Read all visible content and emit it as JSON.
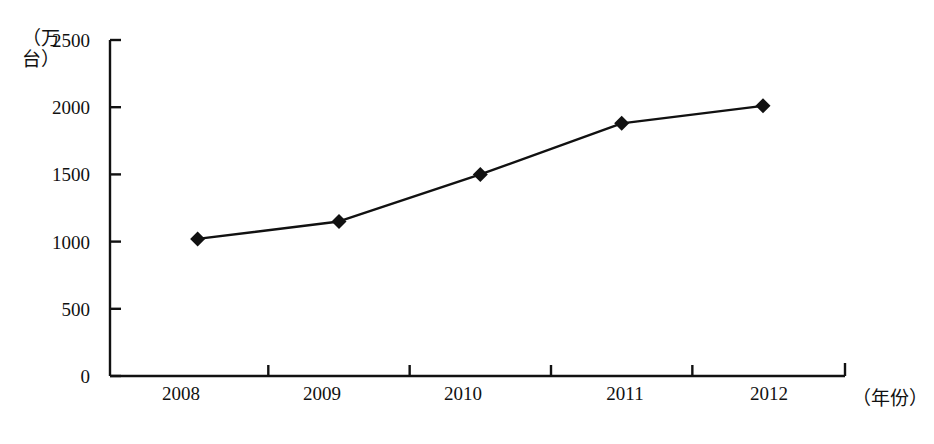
{
  "chart_data": {
    "type": "line",
    "title": "",
    "subtitle": "",
    "xlabel": "（年份）",
    "ylabel": "（万台）",
    "categories": [
      "2008",
      "2009",
      "2010",
      "2011",
      "2012"
    ],
    "values": [
      1020,
      1150,
      1500,
      1880,
      2010
    ],
    "series": [
      {
        "name": "",
        "values": [
          1020,
          1150,
          1500,
          1880,
          2010
        ]
      }
    ],
    "ylim": [
      0,
      2500
    ],
    "yticks": [
      0,
      500,
      1000,
      1500,
      2000,
      2500
    ],
    "ytick_labels": [
      "0",
      "500",
      "1000",
      "1500",
      "2000",
      "2500"
    ],
    "grid": false,
    "legend": false,
    "legend_position": "none",
    "marker": "diamond",
    "line_color": "#111111",
    "marker_color": "#111111",
    "background_color": "#ffffff",
    "axis_color": "#111111",
    "annotations": []
  },
  "axis": {
    "y_title_text": "（万台）",
    "x_title_text": "（年份）"
  }
}
